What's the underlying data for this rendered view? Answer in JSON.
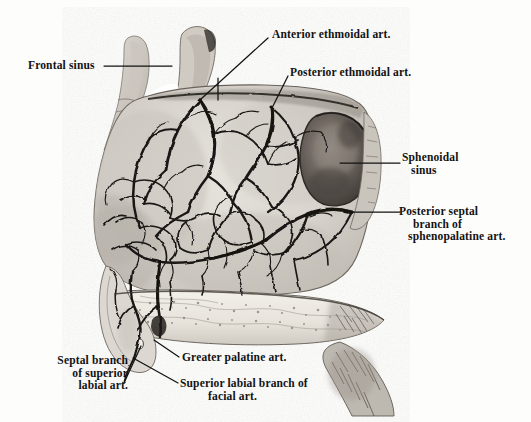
{
  "plate": {
    "title": "Arteries of the nasal septum",
    "view": "medial view of nasal septum, sagittal section",
    "width": 531,
    "height": 422,
    "background_color": "#fdfdfc",
    "ink_color": "#121212",
    "medium": "halftone engraving"
  },
  "labels": [
    {
      "id": "frontal-sinus",
      "text": "Frontal sinus",
      "x": 28,
      "y": 59,
      "align": "left",
      "leader": {
        "type": "straight",
        "from": [
          104,
          66
        ],
        "to": [
          172,
          66
        ]
      },
      "target_structure": "frontal sinus cavity"
    },
    {
      "id": "anterior-ethmoidal-art",
      "text": "Anterior ethmoidal art.",
      "x": 272,
      "y": 28,
      "align": "left",
      "leader": {
        "type": "straight",
        "from": [
          268,
          38
        ],
        "to": [
          201,
          99
        ]
      },
      "target_structure": "anterior ethmoidal artery"
    },
    {
      "id": "posterior-ethmoidal-art",
      "text": "Posterior ethmoidal art.",
      "x": 290,
      "y": 66,
      "align": "left",
      "leader": {
        "type": "straight",
        "from": [
          288,
          76
        ],
        "to": [
          272,
          108
        ]
      },
      "target_structure": "posterior ethmoidal artery"
    },
    {
      "id": "sphenoidal-sinus",
      "text": "Sphenoidal\nsinus",
      "line1": "Sphenoidal",
      "line2": "sinus",
      "x": 402,
      "y": 157,
      "align": "left",
      "leader": {
        "type": "straight",
        "from": [
          400,
          163
        ],
        "to": [
          340,
          163
        ]
      },
      "target_structure": "sphenoidal sinus"
    },
    {
      "id": "posterior-septal-branch",
      "text": "Posterior septal\nbranch of\nsphenopalatine art.",
      "line1": "Posterior septal",
      "line2": "branch of",
      "line3": "sphenopalatine art.",
      "x": 402,
      "y": 208,
      "align": "left",
      "leader": {
        "type": "straight",
        "from": [
          400,
          212
        ],
        "to": [
          352,
          212
        ]
      },
      "target_structure": "posterior septal branch of sphenopalatine artery"
    },
    {
      "id": "greater-palatine-art",
      "text": "Greater palatine art.",
      "x": 182,
      "y": 353,
      "align": "left",
      "leader": {
        "type": "straight",
        "from": [
          179,
          357
        ],
        "to": [
          154,
          340
        ]
      },
      "target_structure": "greater palatine artery"
    },
    {
      "id": "septal-branch-superior-labial",
      "text": "Septal branch\nof superior\nlabial art.",
      "line1": "Septal branch",
      "line2": "of superior",
      "line3": "labial art.",
      "x": 36,
      "y": 356,
      "align": "left",
      "leader": {
        "type": "straight",
        "from": [
          124,
          383
        ],
        "to": [
          141,
          346
        ]
      },
      "target_structure": "septal branch of superior labial artery"
    },
    {
      "id": "superior-labial-branch-facial",
      "text": "Superior labial branch of\nfacial art.",
      "line1": "Superior labial branch of",
      "line2": "facial art.",
      "x": 180,
      "y": 379,
      "align": "left",
      "leader": {
        "type": "straight",
        "from": [
          178,
          383
        ],
        "to": [
          133,
          358
        ]
      },
      "target_structure": "superior labial branch of facial artery"
    }
  ],
  "structures": [
    {
      "id": "nasal-septum-body",
      "name": "nasal septum mucosa",
      "tone": "#d9d6d0"
    },
    {
      "id": "sphenoidal-sinus-cavity",
      "name": "sphenoidal sinus cavity",
      "tone": "#5a544f"
    },
    {
      "id": "hard-palate",
      "name": "hard palate",
      "tone": "#efece5"
    },
    {
      "id": "frontal-sinus-cavity",
      "name": "frontal sinus cavity",
      "tone": "#cdc9c2"
    },
    {
      "id": "arterial-network",
      "name": "septal arterial plexus",
      "tone": "#1c1a18"
    }
  ]
}
